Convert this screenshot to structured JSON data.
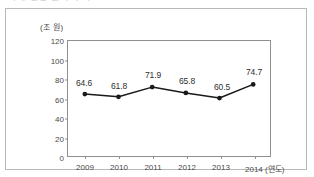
{
  "top_cut_text": "가계 신용 잔액 추이",
  "chart_data": {
    "type": "line",
    "title": "",
    "unit_label": "(조 원)",
    "xlabel": "(연도)",
    "ylabel": "",
    "categories": [
      "2009",
      "2010",
      "2011",
      "2012",
      "2013",
      "2014"
    ],
    "values": [
      64.6,
      61.8,
      71.9,
      65.8,
      60.5,
      74.7
    ],
    "value_labels": [
      "64.6",
      "61.8",
      "71.9",
      "65.8",
      "60.5",
      "74.7"
    ],
    "ylim": [
      0,
      120
    ],
    "yticks": [
      0,
      20,
      40,
      60,
      80,
      100,
      120
    ],
    "ytick_labels": [
      "0",
      "20",
      "40",
      "60",
      "80",
      "100",
      "120"
    ],
    "grid": false,
    "legend": "none",
    "series": [
      {
        "name": "",
        "values": [
          64.6,
          61.8,
          71.9,
          65.8,
          60.5,
          74.7
        ],
        "line_color": "#1a1a1a",
        "marker": "circle",
        "marker_color": "#1a1a1a"
      }
    ],
    "colors": {
      "line": "#1a1a1a",
      "marker": "#1a1a1a",
      "axis": "#8f8f8f",
      "frame": "#b9b9b9",
      "text": "#4a4a4a",
      "background": "#ffffff"
    }
  }
}
